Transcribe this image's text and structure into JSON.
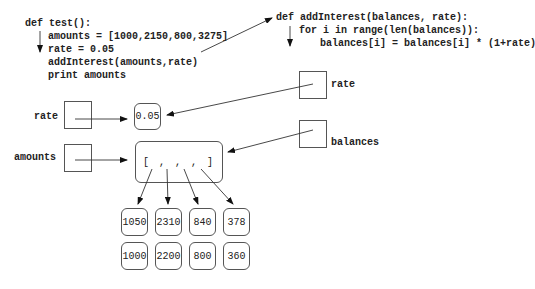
{
  "test_function": {
    "lines": [
      "def test():",
      "amounts = [1000,2150,800,3275]",
      "rate = 0.05",
      "addInterest(amounts,rate)",
      "print amounts"
    ]
  },
  "add_interest_function": {
    "lines": [
      "def addInterest(balances, rate):",
      "for i in range(len(balances)):",
      "balances[i] = balances[i] * (1+rate)"
    ]
  },
  "variables": {
    "test_rate": "rate",
    "test_amounts": "amounts",
    "param_rate": "rate",
    "param_balances": "balances"
  },
  "values": {
    "rate_value": "0.05",
    "list_literal": "[ , , , ]"
  },
  "new_values": [
    "1050",
    "2310",
    "840",
    "378"
  ],
  "old_values": [
    "1000",
    "2200",
    "800",
    "360"
  ]
}
